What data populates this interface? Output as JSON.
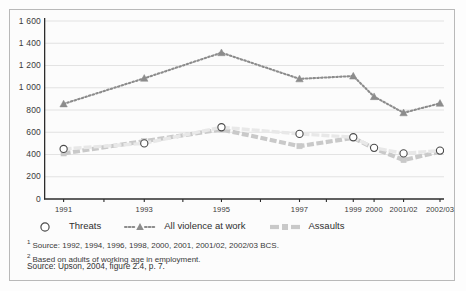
{
  "chart_data": {
    "type": "line",
    "title": "",
    "subtitle": "",
    "xlabel": "",
    "ylabel": "",
    "categories": [
      "1991",
      "1993",
      "1995",
      "1997",
      "1999",
      "2000",
      "2001/02",
      "2002/03"
    ],
    "x_tick_labels": [
      "1991",
      "1993",
      "1995",
      "1997",
      "1999",
      "2000",
      "2001/02",
      "2002/03"
    ],
    "y_tick_labels": [
      "0",
      "200",
      "400",
      "600",
      "800",
      "1 000",
      "1 200",
      "1 400",
      "1 600"
    ],
    "y_ticks": [
      0,
      200,
      400,
      600,
      800,
      1000,
      1200,
      1400,
      1600
    ],
    "ylim": [
      0,
      1600
    ],
    "grid": "horizontal",
    "legend_position": "below-axis",
    "series": [
      {
        "name": "Threats",
        "marker": "open-circle",
        "line_style": "solid-light",
        "color": "#e8e8e8",
        "marker_color": "#ffffff",
        "marker_edge": "#555555",
        "values": [
          450,
          500,
          645,
          585,
          555,
          460,
          410,
          435
        ]
      },
      {
        "name": "All violence at work",
        "marker": "filled-triangle",
        "line_style": "dotted",
        "color": "#8c8c8c",
        "marker_color": "#8c8c8c",
        "marker_edge": "#8c8c8c",
        "values": [
          855,
          1085,
          1315,
          1080,
          1105,
          920,
          775,
          860
        ]
      },
      {
        "name": "Assaults",
        "marker": "filled-square",
        "line_style": "dashed-thick",
        "color": "#c9c9c9",
        "marker_color": "#c9c9c9",
        "marker_edge": "#c9c9c9",
        "values": [
          410,
          520,
          625,
          475,
          550,
          455,
          350,
          425
        ]
      }
    ]
  },
  "legend": {
    "items": [
      {
        "label": "Threats",
        "marker": "open-circle"
      },
      {
        "label": "All violence at work",
        "marker": "dotted-triangle"
      },
      {
        "label": "Assaults",
        "marker": "dashed-square"
      }
    ]
  },
  "footnotes": [
    {
      "marker": "1",
      "text": "Source: 1992, 1994, 1996, 1998, 2000, 2001, 2001/02, 2002/03 BCS."
    },
    {
      "marker": "2",
      "text": "Based on adults of working age in employment."
    }
  ],
  "source": "Source: Upson, 2004, figure 2.4, p. 7.",
  "colors": {
    "frame": "#b9b9b9",
    "axis": "#3a3a3a",
    "grid": "#dcdcdc",
    "background": "#fcfcfc",
    "violence": "#8c8c8c",
    "assaults": "#c9c9c9",
    "threats": "#e8e8e8"
  }
}
